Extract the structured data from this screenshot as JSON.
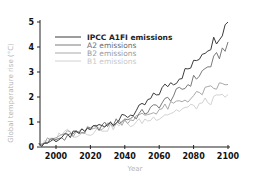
{
  "chart_data": {
    "type": "line",
    "title": "",
    "xlabel": "Year",
    "ylabel": "Global temperature rise (°C)",
    "xlim": [
      1990,
      2100
    ],
    "ylim": [
      0,
      5
    ],
    "xticks": [
      2000,
      2020,
      2040,
      2060,
      2080,
      2100
    ],
    "yticks": [
      0,
      1,
      2,
      3,
      4,
      5
    ],
    "grid": false,
    "legend_position": "upper-left",
    "x": [
      1990,
      1995,
      2000,
      2005,
      2010,
      2015,
      2020,
      2025,
      2030,
      2035,
      2040,
      2045,
      2050,
      2055,
      2060,
      2065,
      2070,
      2075,
      2080,
      2085,
      2090,
      2095,
      2100
    ],
    "series": [
      {
        "name": "IPCC A1FI emissions",
        "color": "#3a3a3a",
        "values": [
          0.05,
          0.2,
          0.3,
          0.4,
          0.5,
          0.6,
          0.75,
          0.85,
          0.95,
          1.05,
          1.2,
          1.35,
          1.6,
          1.9,
          2.2,
          2.5,
          2.7,
          3.0,
          3.3,
          3.8,
          4.1,
          4.5,
          5.0
        ]
      },
      {
        "name": "A2 emissions",
        "color": "#7a7a7a",
        "values": [
          0.05,
          0.2,
          0.3,
          0.4,
          0.55,
          0.6,
          0.7,
          0.8,
          0.9,
          1.0,
          1.1,
          1.2,
          1.35,
          1.5,
          1.7,
          1.9,
          2.15,
          2.4,
          2.7,
          3.0,
          3.3,
          3.7,
          4.2
        ]
      },
      {
        "name": "B2 emissions",
        "color": "#a8a8a8",
        "values": [
          0.05,
          0.25,
          0.35,
          0.55,
          0.5,
          0.6,
          0.7,
          0.8,
          0.85,
          0.95,
          1.05,
          1.15,
          1.25,
          1.35,
          1.5,
          1.6,
          1.75,
          1.9,
          2.0,
          2.2,
          2.3,
          2.45,
          2.5
        ]
      },
      {
        "name": "B1 emissions",
        "color": "#d2d2d2",
        "values": [
          0.05,
          0.2,
          0.35,
          0.7,
          0.5,
          0.55,
          0.6,
          0.7,
          0.75,
          0.85,
          0.95,
          0.9,
          1.05,
          1.1,
          1.25,
          1.35,
          1.45,
          1.55,
          1.6,
          1.75,
          1.85,
          1.95,
          2.1
        ]
      }
    ]
  },
  "axes": {
    "x_title": "Year",
    "y_title": "Global temperature rise (°C)",
    "x_ticks": [
      "2000",
      "2020",
      "2040",
      "2060",
      "2080",
      "2100"
    ],
    "y_ticks": [
      "0",
      "1",
      "2",
      "3",
      "4",
      "5"
    ]
  },
  "legend": {
    "items": [
      {
        "label": "IPCC A1FI emissions",
        "color": "#3a3a3a"
      },
      {
        "label": "A2 emissions",
        "color": "#7a7a7a"
      },
      {
        "label": "B2 emissions",
        "color": "#a8a8a8"
      },
      {
        "label": "B1 emissions",
        "color": "#d2d2d2"
      }
    ]
  }
}
